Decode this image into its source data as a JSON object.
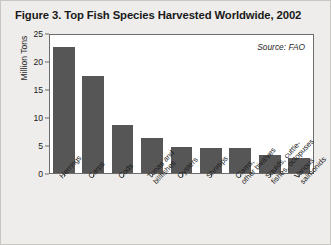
{
  "figure": {
    "title": "Figure 3. Top Fish Species Harvested Worldwide, 2002",
    "source_note": "Source: FAO",
    "background_color": "#eeedeb",
    "bar_color": "#565656",
    "plot_background": "#ffffff",
    "frame_color": "#6e6c6a"
  },
  "chart_data": {
    "type": "bar",
    "title": "Figure 3. Top Fish Species Harvested Worldwide, 2002",
    "xlabel": "",
    "ylabel": "Million Tons",
    "ylim": [
      0,
      25
    ],
    "yticks": [
      0,
      5,
      10,
      15,
      20,
      25
    ],
    "ytick_labels": [
      "0",
      "5",
      "10",
      "15",
      "20",
      "25"
    ],
    "grid": false,
    "legend": "none",
    "annotations": [
      "Source: FAO"
    ],
    "categories": [
      "Herrings",
      "Carps",
      "Cods",
      "Tunas and\nbillfishes",
      "Oysters",
      "Shrimps",
      "Clams,\nother bivalves",
      "Squids, cuttle-\nfishes, octopuses",
      "Various\nsalmonids"
    ],
    "categories_display": [
      "Herrings",
      "Carps",
      "Cods",
      "Tunas and billfishes",
      "Oysters",
      "Shrimps",
      "Clams, other bivalves",
      "Squids, cuttlefishes, octopuses",
      "Various salmonids"
    ],
    "values": [
      22.5,
      17.3,
      8.5,
      6.3,
      4.7,
      4.5,
      4.5,
      3.3,
      2.7
    ]
  },
  "x_labels": [
    {
      "line1": "Herrings",
      "line2": ""
    },
    {
      "line1": "Carps",
      "line2": ""
    },
    {
      "line1": "Cods",
      "line2": ""
    },
    {
      "line1": "Tunas and",
      "line2": "billfishes"
    },
    {
      "line1": "Oysters",
      "line2": ""
    },
    {
      "line1": "Shrimps",
      "line2": ""
    },
    {
      "line1": "Clams,",
      "line2": "other bivalves"
    },
    {
      "line1": "Squids, cuttle-",
      "line2": "fishes, octopuses"
    },
    {
      "line1": "Various",
      "line2": "salmonids"
    }
  ]
}
